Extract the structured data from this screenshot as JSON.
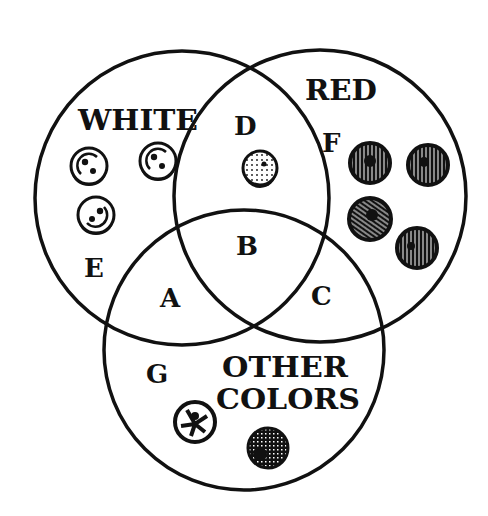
{
  "diagram": {
    "type": "venn",
    "sets": [
      {
        "id": "white",
        "label": "WHITE"
      },
      {
        "id": "red",
        "label": "RED"
      },
      {
        "id": "other",
        "label_line1": "OTHER",
        "label_line2": "COLORS"
      }
    ],
    "regions": {
      "A": "A",
      "B": "B",
      "C": "C",
      "D": "D",
      "E": "E",
      "F": "F",
      "G": "G"
    },
    "items": {
      "white_only": 3,
      "white_and_red": 1,
      "red_only": 4,
      "other_only": 2
    },
    "colors": {
      "ink": "#111111",
      "background": "#ffffff"
    }
  }
}
